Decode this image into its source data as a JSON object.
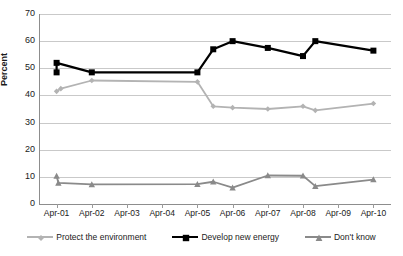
{
  "chart_data": {
    "type": "line",
    "title": "",
    "subtitle": "",
    "xlabel": "",
    "ylabel": "Percent",
    "categories": [
      "Apr-01",
      "Apr-02",
      "Apr-03",
      "Apr-04",
      "Apr-05",
      "Apr-06",
      "Apr-07",
      "Apr-08",
      "Apr-09",
      "Apr-10"
    ],
    "ylim": [
      0,
      70
    ],
    "ytick_values": [
      0,
      10,
      20,
      30,
      40,
      50,
      60,
      70
    ],
    "ytick_labels": [
      "0",
      "10",
      "20",
      "30",
      "40",
      "50",
      "60",
      "70"
    ],
    "grid": true,
    "grid_axis": "y",
    "legend_position": "bottom",
    "series": [
      {
        "name": "Protect the environment",
        "color": "#b3b3b3",
        "marker": "diamond",
        "x": [
          1.0,
          1.12,
          2.0,
          5.0,
          5.45,
          6.0,
          7.0,
          8.0,
          8.35,
          10.0
        ],
        "values": [
          41.5,
          42.5,
          45.5,
          45.0,
          36.0,
          35.5,
          35.0,
          36.0,
          34.5,
          37.0
        ]
      },
      {
        "name": "Develop new energy",
        "color": "#000000",
        "marker": "square",
        "x": [
          1.0,
          1.0,
          2.0,
          5.0,
          5.45,
          6.0,
          7.0,
          8.0,
          8.35,
          10.0
        ],
        "values": [
          48.5,
          52.0,
          48.5,
          48.5,
          57.0,
          60.0,
          57.5,
          54.5,
          60.0,
          56.5
        ]
      },
      {
        "name": "Don't know",
        "color": "#8a8a8a",
        "marker": "triangle",
        "x": [
          1.0,
          1.05,
          2.0,
          5.0,
          5.45,
          6.0,
          7.0,
          8.0,
          8.35,
          10.0
        ],
        "values": [
          10.3,
          7.8,
          7.2,
          7.3,
          8.2,
          6.0,
          10.5,
          10.4,
          6.6,
          9.0
        ]
      }
    ]
  },
  "legend": {
    "items": [
      {
        "label": "Protect the environment",
        "color": "#b3b3b3",
        "marker": "diamond"
      },
      {
        "label": "Develop new energy",
        "color": "#000000",
        "marker": "square"
      },
      {
        "label": "Don't know",
        "color": "#8a8a8a",
        "marker": "triangle"
      }
    ]
  }
}
